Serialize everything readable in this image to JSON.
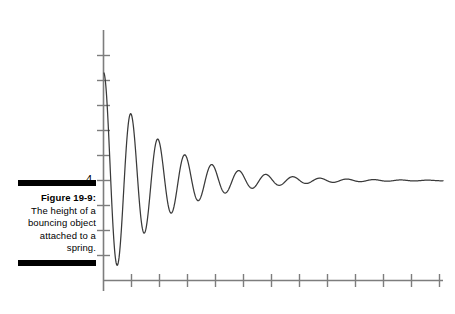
{
  "figure": {
    "caption_label": "Figure 19-9:",
    "caption_body": "The height of a bouncing object attached to a spring.",
    "rule_color": "#000000"
  },
  "chart_data": {
    "type": "line",
    "title": "",
    "xlabel": "",
    "ylabel": "",
    "subtitle": "",
    "legend": [],
    "grid": false,
    "annotations": [],
    "y_tick_labels": [
      "4"
    ],
    "y_tick_label_value": 4,
    "y_tick_count": 10,
    "x_tick_count": 12,
    "x_tick_labels": [],
    "axis_color": "#7d7d7d",
    "curve_color": "#3a3a3a",
    "equilibrium_value": 4,
    "damping_per_period": 0.62,
    "initial_amplitude": 4.3,
    "period": 27,
    "xlim": [
      0,
      12
    ],
    "ylim": [
      0,
      10
    ],
    "series": [
      {
        "name": "height",
        "x": [
          0.0,
          0.2,
          0.4,
          0.6,
          0.8,
          1.0,
          1.2,
          1.4,
          1.6,
          1.8,
          2.0,
          2.2,
          2.4,
          2.6,
          2.8,
          3.0,
          3.2,
          3.4,
          3.6,
          3.8,
          4.0,
          4.2,
          4.4,
          4.6,
          4.8,
          5.0,
          5.2,
          5.4,
          5.6,
          5.8,
          6.0,
          6.4,
          6.8,
          7.2,
          7.6,
          8.0,
          8.4,
          8.8,
          9.2,
          9.6,
          10.0,
          10.6,
          11.2,
          11.8,
          12.0
        ],
        "y": [
          6.9,
          5.9,
          4.3,
          2.9,
          2.1,
          2.2,
          3.2,
          4.6,
          5.6,
          5.9,
          5.4,
          4.4,
          3.4,
          2.8,
          2.9,
          3.5,
          4.4,
          5.1,
          5.3,
          5.0,
          4.4,
          3.7,
          3.3,
          3.4,
          3.8,
          4.4,
          4.8,
          4.9,
          4.6,
          4.2,
          3.8,
          3.7,
          4.3,
          4.6,
          4.2,
          3.9,
          4.1,
          4.4,
          4.2,
          4.0,
          4.1,
          4.2,
          4.0,
          4.1,
          4.1
        ]
      }
    ]
  }
}
